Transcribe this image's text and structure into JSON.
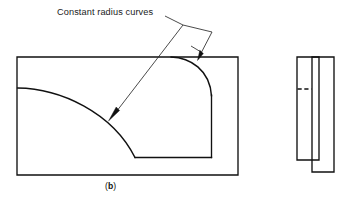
{
  "figure": {
    "caption": "(b)",
    "caption_prefix": "(",
    "caption_letter": "b",
    "caption_suffix": ")",
    "annotation_label": "Constant radius curves",
    "line_color": "#111111",
    "leader_color": "#2b2b2b",
    "background_color": "#ffffff",
    "front_view": {
      "name": "front-view",
      "outer_rect": {
        "x": 17,
        "y": 57,
        "width": 221,
        "height": 118
      },
      "inner_profile_note": "rounded corner fillet and swept curve",
      "fillet_label": "constant radius fillet",
      "sweep_label": "constant radius sweep"
    },
    "side_view": {
      "name": "side-view",
      "left_rect": {
        "x": 297,
        "y": 57,
        "width": 22,
        "height": 103
      },
      "right_rect": {
        "x": 312,
        "y": 57,
        "width": 22,
        "height": 115
      },
      "hidden_line_label": "hidden edge"
    },
    "leader": {
      "name": "annotation-leader",
      "arrow_top_label": "arrow to fillet curve",
      "arrow_bottom_label": "arrow to sweep curve"
    }
  }
}
